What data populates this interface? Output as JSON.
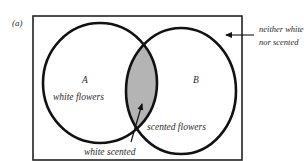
{
  "figure": {
    "panel_label": "(a)",
    "set_a": {
      "letter": "A",
      "description": "white flowers"
    },
    "set_b": {
      "letter": "B",
      "description": "scented flowers"
    },
    "intersection": {
      "description": "white scented"
    },
    "outside": {
      "line1": "neither white",
      "line2": "nor scented"
    },
    "colors": {
      "outline": "#111111",
      "intersection_fill": "#b4b4b4",
      "background": "#ffffff",
      "text": "#2a2a2a"
    }
  }
}
